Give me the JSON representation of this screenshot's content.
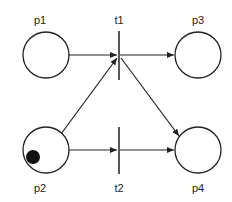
{
  "diagram": {
    "type": "petri-net",
    "colors": {
      "stroke": "#222222",
      "token": "#111111",
      "background": "#ffffff"
    },
    "places": [
      {
        "id": "p1",
        "label": "p1",
        "tokens": 0
      },
      {
        "id": "p2",
        "label": "p2",
        "tokens": 1
      },
      {
        "id": "p3",
        "label": "p3",
        "tokens": 0
      },
      {
        "id": "p4",
        "label": "p4",
        "tokens": 0
      }
    ],
    "transitions": [
      {
        "id": "t1",
        "label": "t1"
      },
      {
        "id": "t2",
        "label": "t2"
      }
    ],
    "arcs": [
      {
        "from": "p1",
        "to": "t1"
      },
      {
        "from": "p2",
        "to": "t1"
      },
      {
        "from": "t1",
        "to": "p3"
      },
      {
        "from": "t1",
        "to": "p4"
      },
      {
        "from": "p2",
        "to": "t2"
      },
      {
        "from": "t2",
        "to": "p4"
      }
    ]
  }
}
